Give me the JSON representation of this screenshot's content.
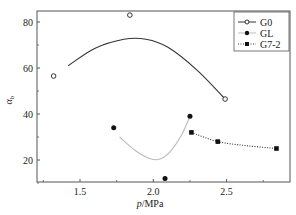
{
  "chart_data": {
    "type": "scatter",
    "title": "",
    "xlabel": "p/MPa",
    "ylabel": "α_b",
    "xlim": [
      1.22,
      2.95
    ],
    "ylim": [
      9,
      85
    ],
    "xticks": [
      1.5,
      2.0,
      2.5
    ],
    "xtick_labels": [
      "1.5",
      "2.0",
      "2.5"
    ],
    "yticks": [
      20,
      40,
      60,
      80
    ],
    "ytick_labels": [
      "20",
      "40",
      "60",
      "80"
    ],
    "grid": false,
    "legend_position": "upper right",
    "series": [
      {
        "name": "G0",
        "marker": "open-circle",
        "line": "solid",
        "x": [
          1.32,
          1.84,
          2.49
        ],
        "y": [
          56.5,
          83,
          46.5
        ],
        "fit_curve": {
          "x": [
            1.42,
            1.6,
            1.8,
            1.95,
            2.1,
            2.3,
            2.49
          ],
          "y": [
            61,
            68.5,
            72.5,
            72.5,
            69,
            59,
            46.5
          ],
          "color": "#333333"
        }
      },
      {
        "name": "GL",
        "marker": "filled-circle",
        "line": "solid-gray",
        "x": [
          1.73,
          2.08,
          2.25
        ],
        "y": [
          34,
          12,
          39
        ],
        "fit_curve": {
          "x": [
            1.77,
            1.88,
            1.98,
            2.05,
            2.12,
            2.19,
            2.25
          ],
          "y": [
            30,
            24,
            20.5,
            20.5,
            24,
            30.5,
            39
          ],
          "color": "#bbbbbb"
        }
      },
      {
        "name": "G7-2",
        "marker": "filled-square",
        "line": "dotted",
        "x": [
          2.26,
          2.44,
          2.84
        ],
        "y": [
          32,
          28,
          25
        ],
        "fit_curve": {
          "x": [
            2.26,
            2.44,
            2.64,
            2.84
          ],
          "y": [
            32,
            28,
            26.2,
            25
          ],
          "color": "#333333"
        }
      }
    ]
  },
  "legend": {
    "items": [
      "G0",
      "GL",
      "G7-2"
    ]
  },
  "axes": {
    "xlabel_italic": "p",
    "xlabel_rest": "/MPa",
    "ylabel_main": "α",
    "ylabel_sub": "b"
  }
}
